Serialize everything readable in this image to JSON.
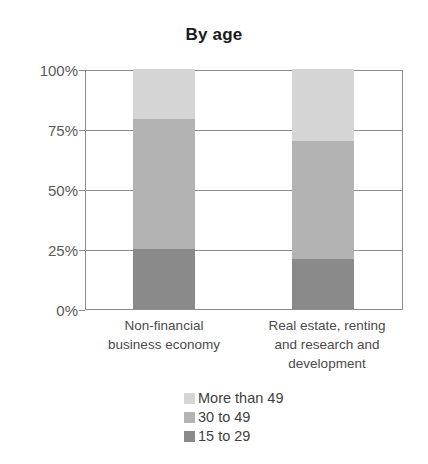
{
  "chart_data": {
    "type": "bar",
    "subtype": "100% stacked bar",
    "title": "By age",
    "xlabel": "",
    "ylabel": "",
    "ylim": [
      0,
      100
    ],
    "yunit": "%",
    "grid": true,
    "legend_position": "bottom",
    "categories": [
      "Non-financial business economy",
      "Real estate, renting and research and development"
    ],
    "category_label_lines": [
      [
        "Non-financial",
        "business economy"
      ],
      [
        "Real estate, renting",
        "and research and",
        "development"
      ]
    ],
    "yticks": [
      "0%",
      "25%",
      "50%",
      "75%",
      "100%"
    ],
    "ytick_values": [
      0,
      25,
      50,
      75,
      100
    ],
    "series": [
      {
        "name": "More than 49",
        "color": "#d5d5d5",
        "values": [
          21,
          30
        ]
      },
      {
        "name": "30 to 49",
        "color": "#b3b3b3",
        "values": [
          54,
          49
        ]
      },
      {
        "name": "15 to 29",
        "color": "#8a8a8a",
        "values": [
          25,
          21
        ]
      }
    ],
    "stack_order_bottom_to_top": [
      "15 to 29",
      "30 to 49",
      "More than 49"
    ],
    "cumulative_tops": [
      {
        "category": "Non-financial business economy",
        "15 to 29": 25,
        "30 to 49": 79,
        "More than 49": 100
      },
      {
        "category": "Real estate, renting and research and development",
        "15 to 29": 21,
        "30 to 49": 70,
        "More than 49": 100
      }
    ],
    "legend_entries": [
      {
        "label": "More than 49",
        "color": "#d5d5d5"
      },
      {
        "label": "30 to 49",
        "color": "#b3b3b3"
      },
      {
        "label": "15 to 29",
        "color": "#8a8a8a"
      }
    ],
    "axis_color": "#8d8d8d",
    "text_color": "#4a4a4a",
    "background": "#ffffff"
  }
}
